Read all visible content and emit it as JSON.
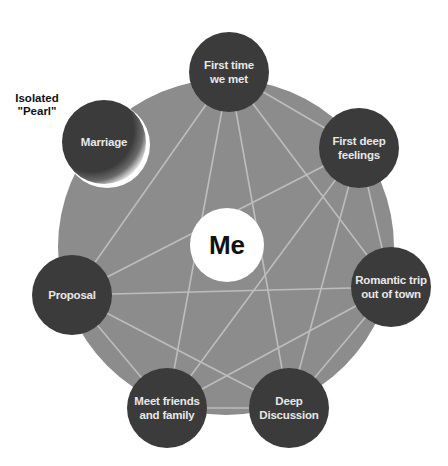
{
  "diagram": {
    "colors": {
      "background_circle": "#8c8c8c",
      "node_fill": "#3b3b3b",
      "edge": "#bdbdbd",
      "center_fill": "#ffffff",
      "node_text": "#e8e8e8",
      "center_text": "#111111"
    },
    "center": {
      "id": "me",
      "label": "Me",
      "x": 227,
      "y": 245,
      "r": 37
    },
    "background": {
      "x": 226,
      "y": 247,
      "r": 168
    },
    "nodes": [
      {
        "id": "first-time",
        "lines": [
          "First time",
          "we met"
        ],
        "x": 229,
        "y": 72,
        "r": 40
      },
      {
        "id": "first-deep",
        "lines": [
          "First deep",
          "feelings"
        ],
        "x": 359,
        "y": 148,
        "r": 40
      },
      {
        "id": "romantic",
        "lines": [
          "Romantic trip",
          "out of town"
        ],
        "x": 391,
        "y": 287,
        "r": 40
      },
      {
        "id": "deep-discussion",
        "lines": [
          "Deep",
          "Discussion"
        ],
        "x": 289,
        "y": 408,
        "r": 40
      },
      {
        "id": "meet-friends",
        "lines": [
          "Meet friends",
          "and family"
        ],
        "x": 167,
        "y": 408,
        "r": 40
      },
      {
        "id": "proposal",
        "lines": [
          "Proposal"
        ],
        "x": 72,
        "y": 295,
        "r": 40
      },
      {
        "id": "marriage",
        "lines": [
          "Marriage"
        ],
        "x": 104,
        "y": 142,
        "r": 42,
        "isolated": true
      }
    ],
    "edges": [
      [
        "first-time",
        "first-deep"
      ],
      [
        "first-time",
        "romantic"
      ],
      [
        "first-time",
        "deep-discussion"
      ],
      [
        "first-time",
        "meet-friends"
      ],
      [
        "first-time",
        "proposal"
      ],
      [
        "first-deep",
        "romantic"
      ],
      [
        "first-deep",
        "deep-discussion"
      ],
      [
        "first-deep",
        "meet-friends"
      ],
      [
        "first-deep",
        "proposal"
      ],
      [
        "romantic",
        "deep-discussion"
      ],
      [
        "romantic",
        "meet-friends"
      ],
      [
        "romantic",
        "proposal"
      ],
      [
        "deep-discussion",
        "meet-friends"
      ],
      [
        "deep-discussion",
        "proposal"
      ],
      [
        "meet-friends",
        "proposal"
      ]
    ],
    "annotation": {
      "line1": "Isolated",
      "line2": "\"Pearl\""
    }
  }
}
